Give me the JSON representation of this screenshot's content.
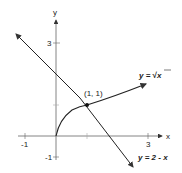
{
  "diagram": {
    "axes": {
      "x_label": "x",
      "y_label": "y",
      "x_ticks": [
        "-1",
        "3"
      ],
      "y_ticks": [
        "3",
        "-1"
      ]
    },
    "curves": [
      {
        "name": "sqrt",
        "label": "y = √x",
        "label_prefix": "y = ",
        "label_radicand": "x"
      },
      {
        "name": "line",
        "label": "y = 2 - x"
      }
    ],
    "intersection": {
      "label": "(1, 1)",
      "x": 1,
      "y": 1
    },
    "colors": {
      "stroke": "#222222",
      "axis": "#555555",
      "background": "#ffffff"
    }
  }
}
